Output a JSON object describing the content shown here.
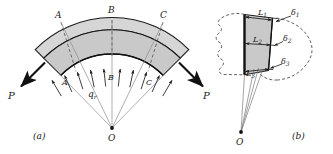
{
  "figure": {
    "background_color": "#ffffff",
    "line_color": "#1a1a1a",
    "fill_gray": "#c9c9c9",
    "fill_gray_light": "#d6d6d6"
  },
  "panel_a": {
    "caption": "(a)",
    "origin_label": "O",
    "load_label": "q",
    "load_label_sub": "r",
    "force_left_label": "P",
    "force_right_label": "P",
    "outer_section_labels": [
      {
        "id": "A",
        "text": "A"
      },
      {
        "id": "B",
        "text": "B"
      },
      {
        "id": "C",
        "text": "C"
      }
    ],
    "inner_section_labels": [
      {
        "id": "A",
        "text": "A"
      },
      {
        "id": "B",
        "text": "B"
      },
      {
        "id": "C",
        "text": "C"
      }
    ]
  },
  "panel_b": {
    "caption": "(b)",
    "origin_label": "O",
    "length_labels": [
      {
        "base": "L",
        "sub": "1"
      },
      {
        "base": "L",
        "sub": "2"
      },
      {
        "base": "L",
        "sub": "3"
      }
    ],
    "deflection_labels": [
      {
        "base": "δ",
        "sub": "1"
      },
      {
        "base": "δ",
        "sub": "2"
      },
      {
        "base": "δ",
        "sub": "3"
      }
    ]
  }
}
